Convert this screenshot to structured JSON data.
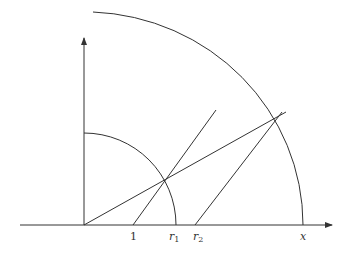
{
  "diagram": {
    "type": "geometric-construction",
    "origin": [
      84,
      225
    ],
    "axes": {
      "x_start": 20,
      "x_end": 332,
      "y_top": 38
    },
    "arcs": [
      {
        "name": "unit-arc",
        "radius": 83
      },
      {
        "name": "outer-arc",
        "radius": 218
      }
    ],
    "labels": {
      "one": "1",
      "r1": "r",
      "r1_sub": "1",
      "r2": "r",
      "r2_sub": "2",
      "x": "x"
    },
    "stroke_color": "#333333"
  }
}
